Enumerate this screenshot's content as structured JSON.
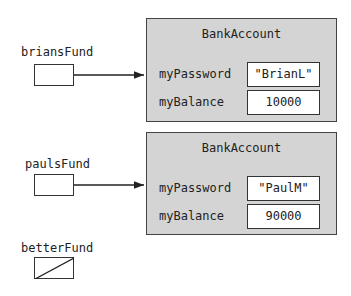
{
  "references": [
    {
      "name": "briansFund",
      "points_to": 0
    },
    {
      "name": "paulsFund",
      "points_to": 1
    },
    {
      "name": "betterFund",
      "points_to": null
    }
  ],
  "objects": [
    {
      "class_name": "BankAccount",
      "fields": [
        {
          "name": "myPassword",
          "value": "\"BrianL\""
        },
        {
          "name": "myBalance",
          "value": "10000"
        }
      ]
    },
    {
      "class_name": "BankAccount",
      "fields": [
        {
          "name": "myPassword",
          "value": "\"PaulM\""
        },
        {
          "name": "myBalance",
          "value": "90000"
        }
      ]
    }
  ],
  "colors": {
    "object_fill": "#d4d4d4",
    "border": "#333333",
    "background": "#ffffff"
  }
}
